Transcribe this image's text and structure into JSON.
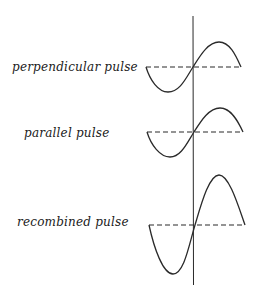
{
  "diagram": {
    "type": "pulse-superposition",
    "axis": {
      "x": 193,
      "y_top": 16,
      "y_bottom": 285
    },
    "pulses": [
      {
        "id": "perpendicular",
        "label": "perpendicular pulse",
        "label_pos": {
          "left": 12,
          "top": 60
        },
        "baseline_y": 67,
        "x_start": 146,
        "x_end": 241,
        "amplitude": 25,
        "phase": "trough-then-peak"
      },
      {
        "id": "parallel",
        "label": "parallel pulse",
        "label_pos": {
          "left": 24,
          "top": 126
        },
        "baseline_y": 132,
        "x_start": 147,
        "x_end": 243,
        "amplitude": 24,
        "phase": "trough-then-peak"
      },
      {
        "id": "recombined",
        "label": "recombined pulse",
        "label_pos": {
          "left": 17,
          "top": 215
        },
        "baseline_y": 225,
        "x_start": 149,
        "x_end": 245,
        "amplitude": 50,
        "phase": "trough-then-peak"
      }
    ],
    "colors": {
      "ink": "#2a2a2a",
      "background": "#ffffff"
    }
  }
}
